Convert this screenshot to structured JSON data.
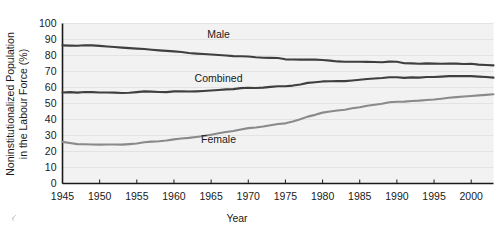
{
  "chart_data": {
    "type": "line",
    "title": "",
    "xlabel": "Year",
    "ylabel": "Noninstitutionalized Population in the Labour Force (%)",
    "ylabel_line1": "Noninstitutionalized Population",
    "ylabel_line2": "in the Labour Force (%)",
    "xlim": [
      1945,
      2003
    ],
    "ylim": [
      0,
      100
    ],
    "grid": true,
    "grid_orientation": "horizontal",
    "legend_position": "inline-annotations",
    "xticks": [
      1945,
      1950,
      1955,
      1960,
      1965,
      1970,
      1975,
      1980,
      1985,
      1990,
      1995,
      2000
    ],
    "xtick_labels": [
      "1945",
      "1950",
      "1955",
      "1960",
      "1965",
      "1970",
      "1975",
      "1980",
      "1985",
      "1990",
      "1995",
      "2000"
    ],
    "yticks": [
      0,
      10,
      20,
      30,
      40,
      50,
      60,
      70,
      80,
      90,
      100
    ],
    "ytick_labels": [
      "0",
      "10",
      "20",
      "30",
      "40",
      "50",
      "60",
      "70",
      "80",
      "90",
      "100"
    ],
    "x": [
      1945,
      1946,
      1947,
      1948,
      1949,
      1950,
      1951,
      1952,
      1953,
      1954,
      1955,
      1956,
      1957,
      1958,
      1959,
      1960,
      1961,
      1962,
      1963,
      1964,
      1965,
      1966,
      1967,
      1968,
      1969,
      1970,
      1971,
      1972,
      1973,
      1974,
      1975,
      1976,
      1977,
      1978,
      1979,
      1980,
      1981,
      1982,
      1983,
      1984,
      1985,
      1986,
      1987,
      1988,
      1989,
      1990,
      1991,
      1992,
      1993,
      1994,
      1995,
      1996,
      1997,
      1998,
      1999,
      2000,
      2001,
      2002,
      2003
    ],
    "series": [
      {
        "name": "Male",
        "color": "#3f3f3f",
        "label_text": "Male",
        "values": [
          86.3,
          86.2,
          86.1,
          86.4,
          86.3,
          86.0,
          85.6,
          85.3,
          84.9,
          84.6,
          84.3,
          84.1,
          83.6,
          83.2,
          82.9,
          82.6,
          82.2,
          81.6,
          81.2,
          80.9,
          80.6,
          80.3,
          80.0,
          79.6,
          79.5,
          79.4,
          78.9,
          78.6,
          78.5,
          78.4,
          77.6,
          77.5,
          77.4,
          77.5,
          77.4,
          77.2,
          76.8,
          76.3,
          76.1,
          76.1,
          76.1,
          76.0,
          75.9,
          75.8,
          76.2,
          76.1,
          75.2,
          75.1,
          74.8,
          75.1,
          74.9,
          74.8,
          75.0,
          74.9,
          74.7,
          74.8,
          74.3,
          74.1,
          73.8
        ]
      },
      {
        "name": "Combined",
        "color": "#3f3f3f",
        "label_text": "Combined",
        "values": [
          56.9,
          57.1,
          56.8,
          57.2,
          57.1,
          56.9,
          56.9,
          56.8,
          56.6,
          56.7,
          57.1,
          57.6,
          57.4,
          57.2,
          57.1,
          57.6,
          57.7,
          57.5,
          57.6,
          57.8,
          58.1,
          58.4,
          58.8,
          59.0,
          59.6,
          59.8,
          59.7,
          59.9,
          60.4,
          60.8,
          60.8,
          61.2,
          61.9,
          62.9,
          63.3,
          63.8,
          63.9,
          64.0,
          64.0,
          64.4,
          64.8,
          65.3,
          65.6,
          65.9,
          66.4,
          66.4,
          66.0,
          66.3,
          66.2,
          66.6,
          66.6,
          66.8,
          67.1,
          67.1,
          67.1,
          67.1,
          66.8,
          66.6,
          66.2
        ]
      },
      {
        "name": "Female",
        "color": "#8a8a8a",
        "label_text": "Female",
        "values": [
          26.0,
          25.3,
          24.6,
          24.5,
          24.4,
          24.3,
          24.4,
          24.4,
          24.3,
          24.6,
          25.0,
          25.8,
          26.2,
          26.4,
          26.9,
          27.6,
          28.1,
          28.5,
          29.1,
          29.7,
          30.5,
          31.4,
          32.2,
          32.8,
          33.8,
          34.6,
          35.0,
          35.6,
          36.4,
          37.2,
          37.6,
          38.7,
          40.2,
          41.8,
          42.9,
          44.3,
          45.0,
          45.6,
          46.1,
          47.0,
          47.7,
          48.6,
          49.2,
          49.8,
          50.8,
          51.1,
          51.2,
          51.6,
          51.8,
          52.2,
          52.5,
          53.0,
          53.6,
          54.0,
          54.4,
          54.7,
          55.1,
          55.4,
          55.8
        ]
      }
    ],
    "annotations": [
      {
        "text": "Male",
        "x": 1966,
        "y": 91
      },
      {
        "text": "Combined",
        "x": 1966,
        "y": 63.5
      },
      {
        "text": "Female",
        "x": 1966,
        "y": 25.5
      }
    ]
  },
  "colors": {
    "plot_background": "#f2f2f2",
    "gridline": "#e3e3e3",
    "axis": "#1a1a1a",
    "male_line": "#3f3f3f",
    "combined_line": "#3f3f3f",
    "female_line": "#8a8a8a",
    "text": "#1a1a1a"
  }
}
